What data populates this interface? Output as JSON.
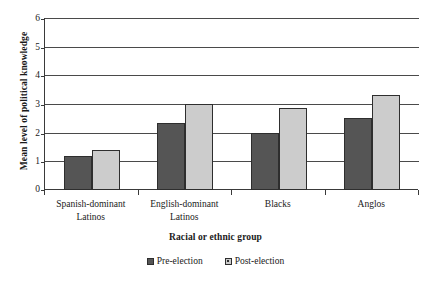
{
  "chart_data": {
    "type": "bar",
    "title": "",
    "xlabel": "Racial or ethnic group",
    "ylabel": "Mean level of political knowledge",
    "categories": [
      "Spanish-dominant Latinos",
      "English-dominant Latinos",
      "Blacks",
      "Anglos"
    ],
    "series": [
      {
        "name": "Pre-election",
        "color": "#555555",
        "values": [
          1.2,
          2.35,
          2.0,
          2.5
        ]
      },
      {
        "name": "Post-election",
        "color": "#cccccc",
        "values": [
          1.4,
          3.0,
          2.85,
          3.3
        ]
      }
    ],
    "ylim": [
      0,
      6
    ],
    "yticks": [
      0,
      1,
      2,
      3,
      4,
      5,
      6
    ],
    "ytick_labels": [
      "0",
      "1",
      "2",
      "3",
      "4",
      "5",
      "6"
    ],
    "grid": true,
    "legend_position": "bottom"
  },
  "axis": {
    "y_title": "Mean level of political knowledge",
    "x_title": "Racial or ethnic group",
    "y_labels": [
      "6",
      "5",
      "4",
      "3",
      "2",
      "1",
      "0"
    ],
    "x_labels": [
      {
        "line1": "Spanish-dominant",
        "line2": "Latinos"
      },
      {
        "line1": "English-dominant",
        "line2": "Latinos"
      },
      {
        "line1": "Blacks",
        "line2": ""
      },
      {
        "line1": "Anglos",
        "line2": ""
      }
    ]
  },
  "legend": {
    "entries": [
      {
        "label": "Pre-election"
      },
      {
        "label": "Post-election"
      }
    ]
  }
}
